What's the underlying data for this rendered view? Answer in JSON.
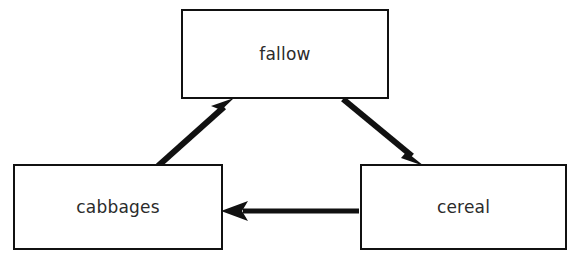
{
  "diagram": {
    "type": "cycle-diagram",
    "background_color": "#ffffff",
    "node_border_color": "#111111",
    "node_fill_color": "#ffffff",
    "arrow_color": "#111111",
    "label_color": "#2b2b2b",
    "nodes": [
      {
        "id": "fallow",
        "label": "fallow",
        "x": 181,
        "y": 9,
        "width": 208,
        "height": 90
      },
      {
        "id": "cabbages",
        "label": "cabbages",
        "x": 13,
        "y": 164,
        "width": 210,
        "height": 86
      },
      {
        "id": "cereal",
        "label": "cereal",
        "x": 360,
        "y": 164,
        "width": 207,
        "height": 86
      }
    ],
    "arrows": [
      {
        "id": "cabbages-to-fallow",
        "from": "cabbages",
        "to": "fallow",
        "direction": "up-right",
        "x1": 158,
        "y1": 166,
        "x2": 233,
        "y2": 99
      },
      {
        "id": "fallow-to-cereal",
        "from": "fallow",
        "to": "cereal",
        "direction": "down-right",
        "x1": 343,
        "y1": 99,
        "x2": 424,
        "y2": 166
      },
      {
        "id": "cereal-to-cabbages",
        "from": "cereal",
        "to": "cabbages",
        "direction": "left",
        "x1": 359,
        "y1": 211,
        "x2": 222,
        "y2": 211
      }
    ]
  }
}
